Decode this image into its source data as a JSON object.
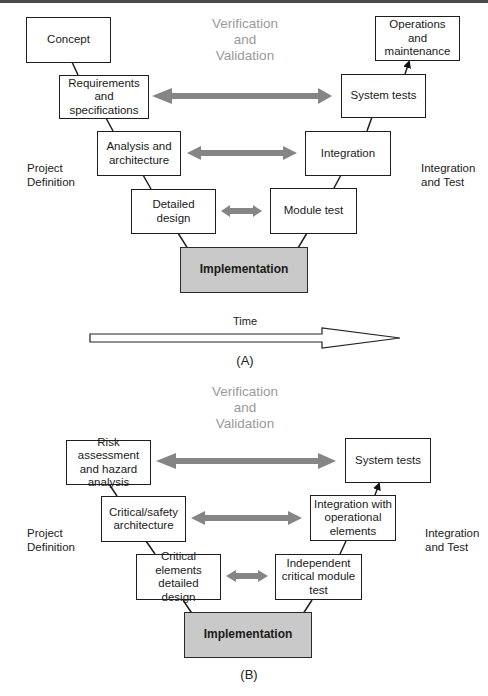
{
  "diagram_a": {
    "id_label": "(A)",
    "vv_title": [
      "Verification",
      "and",
      "Validation"
    ],
    "left_phase_label": [
      "Project",
      "Definition"
    ],
    "right_phase_label": [
      "Integration",
      "and Test"
    ],
    "left_boxes": [
      {
        "id": "concept",
        "label": "Concept"
      },
      {
        "id": "requirements",
        "label": "Requirements and specifications"
      },
      {
        "id": "analysis",
        "label": "Analysis and architecture"
      },
      {
        "id": "detailed-design",
        "label": "Detailed design"
      }
    ],
    "bottom_box": {
      "id": "implementation",
      "label": "Implementation"
    },
    "right_boxes": [
      {
        "id": "module-test",
        "label": "Module test"
      },
      {
        "id": "integration",
        "label": "Integration"
      },
      {
        "id": "system-tests",
        "label": "System tests"
      },
      {
        "id": "operations",
        "label": "Operations and maintenance"
      }
    ],
    "time_label": "Time"
  },
  "diagram_b": {
    "id_label": "(B)",
    "vv_title": [
      "Verification",
      "and",
      "Validation"
    ],
    "left_phase_label": [
      "Project",
      "Definition"
    ],
    "right_phase_label": [
      "Integration",
      "and Test"
    ],
    "left_boxes": [
      {
        "id": "risk-assessment",
        "label": "Risk assessment and hazard analysis"
      },
      {
        "id": "critical-safety-architecture",
        "label": "Critical/safety architecture"
      },
      {
        "id": "critical-elements-detailed-design",
        "label": "Critical elements detailed design"
      }
    ],
    "bottom_box": {
      "id": "implementation",
      "label": "Implementation"
    },
    "right_boxes": [
      {
        "id": "independent-critical-module-test",
        "label": "Independent critical module test"
      },
      {
        "id": "integration-operational",
        "label": "Integration with operational elements"
      },
      {
        "id": "system-tests",
        "label": "System tests"
      }
    ]
  },
  "colors": {
    "box_border": "#1e1e1e",
    "implementation_fill": "#c9c9c9",
    "vv_arrow": "#858585",
    "vv_text": "#9a9a9a"
  }
}
